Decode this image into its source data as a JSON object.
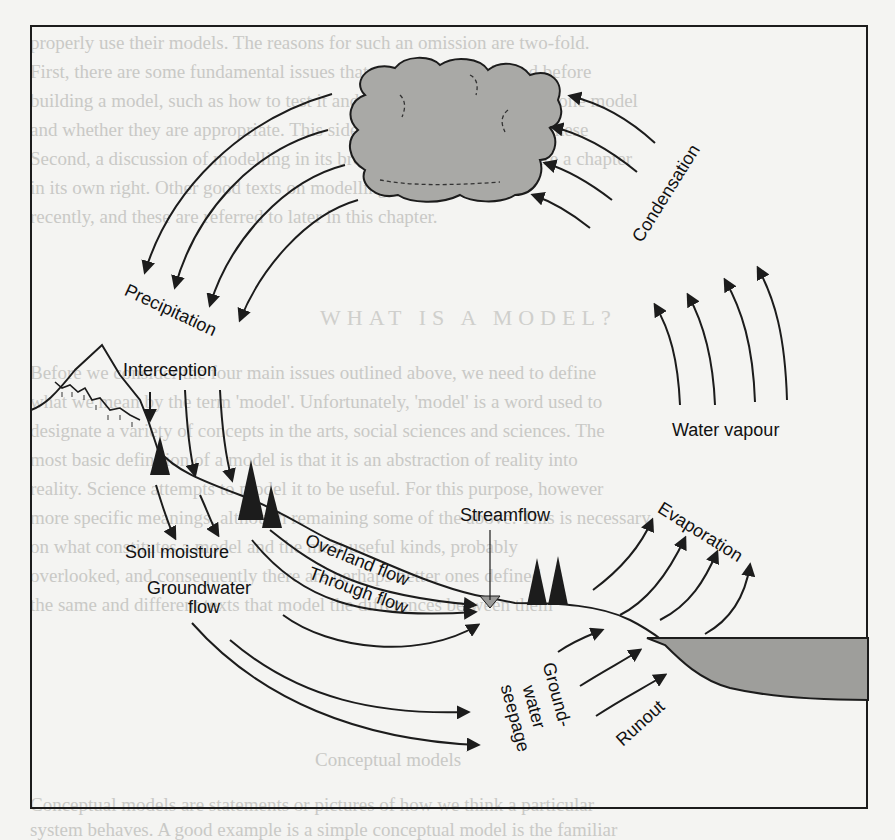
{
  "page": {
    "background_text": [
      "properly use their models. The reasons for such an omission are two-fold.",
      "First, there are some fundamental issues that need to be considered before",
      "building a model, such as how to test it and whether we should make one model",
      "and whether they are appropriate. This side of modelling is given in these",
      "Second, a discussion of modelling in its broadest sense would require a chapter",
      "in its own right. Other good texts on modelling have been written",
      "recently, and these are referred to later in this chapter."
    ],
    "background_heading": "WHAT IS A MODEL?",
    "background_text_2": [
      "Before we consider the four main issues outlined above, we need to define",
      "what we mean by the term 'model'. Unfortunately, 'model' is a word used to",
      "designate a variety of concepts in the arts, social sciences and sciences. The",
      "most basic definition of a model is that it is an abstraction of reality into",
      "reality. Science attempts to model it to be useful. For this purpose, however",
      "more specific meanings, although remaining some of the above. This is necessary",
      "on what constitutes a model and the most useful kinds, probably",
      "overlooked, and consequently there are perhaps better ones defined",
      "the same and different texts that model the differences between them"
    ],
    "background_subheading": "Conceptual models",
    "background_text_3": [
      "Conceptual models are statements or pictures of how we think a particular",
      "system behaves. A good example is a simple conceptual model is the familiar"
    ]
  },
  "diagram": {
    "labels": {
      "condensation": "Condensation",
      "precipitation": "Precipitation",
      "interception": "Interception",
      "water_vapour": "Water vapour",
      "soil_moisture": "Soil moisture",
      "groundwater_flow_1": "Groundwater",
      "groundwater_flow_2": "flow",
      "overland_flow": "Overland flow",
      "through_flow": "Through flow",
      "streamflow": "Streamflow",
      "evaporation": "Evaporation",
      "groundwater_seepage_1": "Ground-",
      "groundwater_seepage_2": "water",
      "groundwater_seepage_3": "seepage",
      "runout": "Runout"
    },
    "colors": {
      "ink": "#1c1c1c",
      "cloud_fill": "#a9a9a6",
      "sea_fill": "#9e9e9b",
      "stream_fill": "#9a9a98",
      "paper": "#f4f4f2"
    }
  }
}
